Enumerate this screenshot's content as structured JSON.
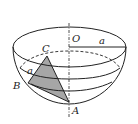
{
  "diagram": {
    "type": "hemisphere-geometry",
    "colors": {
      "stroke": "#222222",
      "triangle_fill": "#a6a6a6",
      "background": "#ffffff"
    },
    "labels": {
      "center": "O",
      "radius": "a",
      "point_c": "C",
      "point_b": "B",
      "point_a": "A",
      "side_bc": "a"
    }
  }
}
